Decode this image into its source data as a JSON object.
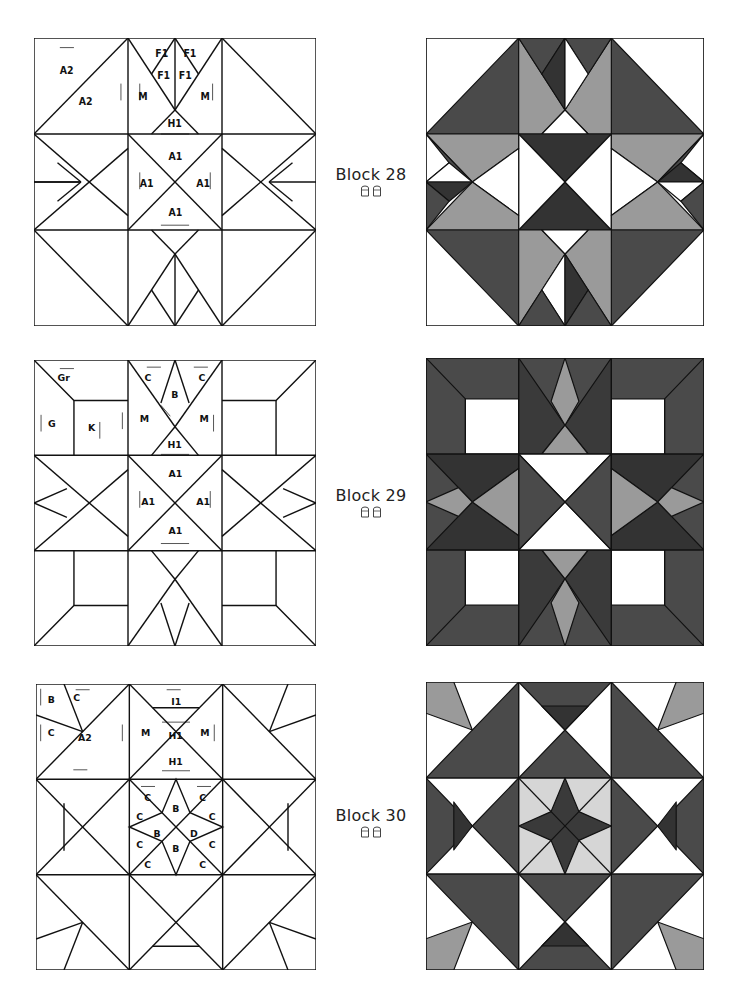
{
  "page": {
    "type": "quilt-block-pattern-sheet",
    "colors": {
      "line": "#111111",
      "white": "#ffffff",
      "dark": "#4a4a4a",
      "darker": "#333333",
      "medium": "#9a9a9a",
      "light": "#d6d6d6"
    }
  },
  "blocks": [
    {
      "title": "Block 28",
      "difficulty_icon": "thimble-icon",
      "difficulty_count": 2,
      "piece_labels": [
        "A2",
        "A2",
        "F1",
        "F1",
        "F1",
        "F1",
        "M",
        "M",
        "H1",
        "A1",
        "A1",
        "A1",
        "A1"
      ]
    },
    {
      "title": "Block 29",
      "difficulty_icon": "thimble-icon",
      "difficulty_count": 2,
      "piece_labels": [
        "Gr",
        "G",
        "K",
        "C",
        "C",
        "B",
        "M",
        "M",
        "H1",
        "A1",
        "A1",
        "A1",
        "A1"
      ]
    },
    {
      "title": "Block 30",
      "difficulty_icon": "thimble-icon",
      "difficulty_count": 2,
      "piece_labels": [
        "B",
        "C",
        "C",
        "A2",
        "I1",
        "M",
        "M",
        "H1",
        "H1",
        "C",
        "C",
        "C",
        "C",
        "C",
        "C",
        "C",
        "C",
        "B",
        "B",
        "B",
        "D"
      ]
    }
  ],
  "labels": {
    "b28": {
      "a2a": "A2",
      "a2b": "A2",
      "f1a": "F1",
      "f1b": "F1",
      "f1c": "F1",
      "f1d": "F1",
      "ma": "M",
      "mb": "M",
      "h1": "H1",
      "a1t": "A1",
      "a1l": "A1",
      "a1r": "A1",
      "a1b": "A1"
    },
    "b29": {
      "gr": "Gr",
      "g": "G",
      "k": "K",
      "ca": "C",
      "cb": "C",
      "b": "B",
      "ma": "M",
      "mb": "M",
      "h1": "H1",
      "a1t": "A1",
      "a1l": "A1",
      "a1r": "A1",
      "a1b": "A1"
    },
    "b30": {
      "b": "B",
      "c1": "C",
      "c2": "C",
      "a2": "A2",
      "i1": "I1",
      "ma": "M",
      "mb": "M",
      "h1a": "H1",
      "h1b": "H1",
      "cc1": "C",
      "cc2": "C",
      "cc3": "C",
      "cc4": "C",
      "cc5": "C",
      "cc6": "C",
      "cc7": "C",
      "cc8": "C",
      "sb1": "B",
      "sb2": "B",
      "sb3": "B",
      "sd": "D"
    }
  }
}
